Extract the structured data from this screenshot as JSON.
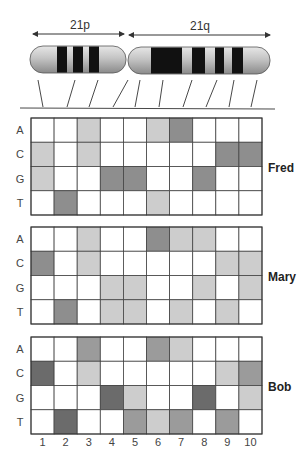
{
  "chromosome": {
    "arms": [
      {
        "label": "21p"
      },
      {
        "label": "21q"
      }
    ]
  },
  "shade_colors": {
    "white": "#ffffff",
    "light": "#cdcdcd",
    "medium": "#9b9b9b",
    "dark": "#8e8e8e",
    "darker": "#6b6b6b"
  },
  "row_labels": [
    "A",
    "C",
    "G",
    "T"
  ],
  "column_labels": [
    "1",
    "2",
    "3",
    "4",
    "5",
    "6",
    "7",
    "8",
    "9",
    "10"
  ],
  "individuals": [
    {
      "name": "Fred",
      "grid": [
        [
          "white",
          "white",
          "light",
          "white",
          "white",
          "light",
          "dark",
          "white",
          "white",
          "white"
        ],
        [
          "light",
          "white",
          "light",
          "white",
          "white",
          "white",
          "white",
          "white",
          "dark",
          "dark"
        ],
        [
          "light",
          "white",
          "white",
          "dark",
          "dark",
          "white",
          "white",
          "dark",
          "white",
          "white"
        ],
        [
          "white",
          "dark",
          "white",
          "white",
          "white",
          "light",
          "white",
          "white",
          "white",
          "white"
        ]
      ]
    },
    {
      "name": "Mary",
      "grid": [
        [
          "white",
          "white",
          "light",
          "white",
          "white",
          "dark",
          "light",
          "light",
          "white",
          "white"
        ],
        [
          "dark",
          "white",
          "light",
          "white",
          "white",
          "white",
          "white",
          "white",
          "light",
          "light"
        ],
        [
          "white",
          "white",
          "white",
          "light",
          "light",
          "white",
          "white",
          "light",
          "white",
          "light"
        ],
        [
          "white",
          "dark",
          "white",
          "light",
          "light",
          "white",
          "light",
          "white",
          "light",
          "white"
        ]
      ]
    },
    {
      "name": "Bob",
      "grid": [
        [
          "white",
          "white",
          "medium",
          "white",
          "white",
          "medium",
          "light",
          "white",
          "white",
          "white"
        ],
        [
          "darker",
          "white",
          "light",
          "white",
          "white",
          "white",
          "white",
          "white",
          "light",
          "medium"
        ],
        [
          "white",
          "white",
          "white",
          "darker",
          "light",
          "white",
          "white",
          "darker",
          "white",
          "light"
        ],
        [
          "white",
          "darker",
          "white",
          "white",
          "medium",
          "light",
          "medium",
          "white",
          "medium",
          "white"
        ]
      ]
    }
  ]
}
